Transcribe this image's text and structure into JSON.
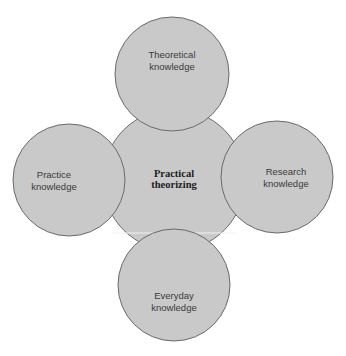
{
  "diagram": {
    "center": {
      "label_line1": "Practical",
      "label_line2": "theorizing"
    },
    "top": {
      "label_line1": "Theoretical",
      "label_line2": "knowledge"
    },
    "left": {
      "label_line1": "Practice",
      "label_line2": "knowledge"
    },
    "right": {
      "label_line1": "Research",
      "label_line2": "knowledge"
    },
    "bottom": {
      "label_line1": "Everyday",
      "label_line2": "knowledge"
    }
  },
  "colors": {
    "fill": "#c9c9c9",
    "stroke": "#6a6a6a",
    "text": "#3a3a3a"
  }
}
